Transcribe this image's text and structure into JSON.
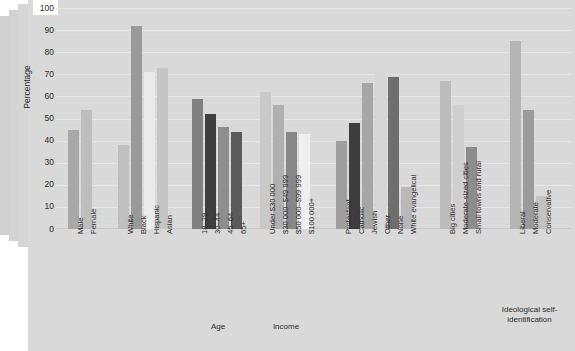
{
  "chart_data": {
    "type": "bar",
    "title": "",
    "xlabel": "",
    "ylabel": "Percentage",
    "ylim": [
      0,
      100
    ],
    "ytick_step": 10,
    "grid": true,
    "legend": "none",
    "yticks": [
      "100",
      "90",
      "80",
      "70",
      "60",
      "50",
      "40",
      "30",
      "20",
      "10",
      "0"
    ],
    "groups": [
      {
        "name": "Gender",
        "label": "",
        "categories": [
          "Male",
          "Female"
        ],
        "values": [
          45,
          54
        ],
        "colors": [
          "#a8a8a8",
          "#bdbdbd"
        ]
      },
      {
        "name": "Race",
        "label": "",
        "categories": [
          "White",
          "Black",
          "Hispanic",
          "Asian"
        ],
        "values": [
          38,
          92,
          71,
          73
        ],
        "colors": [
          "#bfbfbf",
          "#9a9a9a",
          "#eaeaea",
          "#c4c4c4"
        ]
      },
      {
        "name": "Age",
        "label": "Age",
        "categories": [
          "18–29",
          "30–44",
          "45–64",
          "65+"
        ],
        "values": [
          59,
          52,
          46,
          44
        ],
        "colors": [
          "#808080",
          "#3f3f3f",
          "#8e8e8e",
          "#5a5a5a"
        ]
      },
      {
        "name": "Income",
        "label": "Income",
        "categories": [
          "Under $30 000",
          "$30 000–$49 999",
          "$50 000–$99 999",
          "$100 000+"
        ],
        "values": [
          62,
          56,
          44,
          43
        ],
        "colors": [
          "#c9c9c9",
          "#b0b0b0",
          "#878787",
          "#efefef"
        ]
      },
      {
        "name": "Religion",
        "label": "",
        "categories": [
          "Protestant",
          "Catholic",
          "Jewish",
          "Other",
          "None",
          "White evangelical"
        ],
        "values": [
          40,
          48,
          66,
          71,
          69,
          19
        ],
        "colors": [
          "#9e9e9e",
          "#3d3d3d",
          "#a6a6a6",
          "#d6d6d6",
          "#6e6e6e",
          "#b8b8b8"
        ]
      },
      {
        "name": "Community type",
        "label": "",
        "categories": [
          "Big cities",
          "Moderate-sized cities",
          "Small towns and rural"
        ],
        "values": [
          67,
          56,
          37,
          0
        ],
        "colors": [
          "#bcbcbc",
          "#cfcfcf",
          "#8d8d8d"
        ]
      },
      {
        "name": "Ideology",
        "label": "Ideological self-\nidentification",
        "categories": [
          "Liberal",
          "Moderate",
          "Conservative"
        ],
        "values": [
          85,
          54,
          15
        ],
        "colors": [
          "#b5b5b5",
          "#9b9b9b",
          "#c2c2c2"
        ]
      }
    ]
  },
  "colors": {
    "panel": "#d9d9d9",
    "grid": "#e6e6e6",
    "text": "#2b2b2b",
    "background": "#ffffff"
  }
}
